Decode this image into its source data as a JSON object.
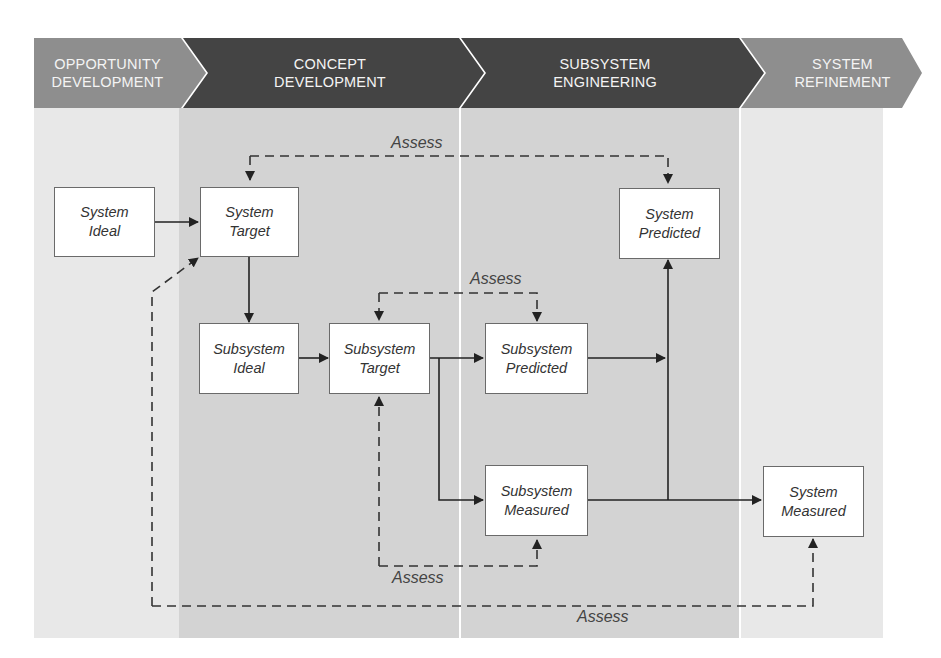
{
  "phases": [
    {
      "line1": "OPPORTUNITY",
      "line2": "DEVELOPMENT",
      "color": "#8e8e8e"
    },
    {
      "line1": "CONCEPT",
      "line2": "DEVELOPMENT",
      "color": "#444444"
    },
    {
      "line1": "SUBSYSTEM",
      "line2": "ENGINEERING",
      "color": "#444444"
    },
    {
      "line1": "SYSTEM",
      "line2": "REFINEMENT",
      "color": "#8e8e8e"
    }
  ],
  "boxes": {
    "system_ideal": {
      "line1": "System",
      "line2": "Ideal"
    },
    "system_target": {
      "line1": "System",
      "line2": "Target"
    },
    "system_predicted": {
      "line1": "System",
      "line2": "Predicted"
    },
    "subsystem_ideal": {
      "line1": "Subsystem",
      "line2": "Ideal"
    },
    "subsystem_target": {
      "line1": "Subsystem",
      "line2": "Target"
    },
    "subsystem_predicted": {
      "line1": "Subsystem",
      "line2": "Predicted"
    },
    "subsystem_measured": {
      "line1": "Subsystem",
      "line2": "Measured"
    },
    "system_measured": {
      "line1": "System",
      "line2": "Measured"
    }
  },
  "assess_labels": {
    "top": "Assess",
    "middle": "Assess",
    "lower": "Assess",
    "bottom": "Assess"
  },
  "colors": {
    "light_column": "#e8e8e8",
    "mid_column": "#d3d3d3",
    "dark_chevron": "#444444",
    "light_chevron": "#8e8e8e"
  }
}
